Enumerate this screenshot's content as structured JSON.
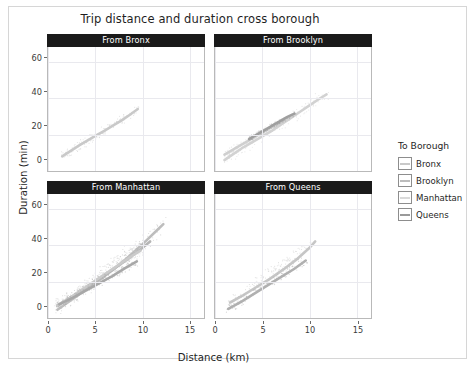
{
  "chart_data": {
    "type": "scatter",
    "title": "Trip distance and duration cross borough",
    "xlabel": "Distance (km)",
    "ylabel": "Duration (min)",
    "xlim": [
      0,
      16.5
    ],
    "ylim": [
      0,
      68
    ],
    "xticks": [
      0,
      5,
      10,
      15
    ],
    "yticks": [
      0,
      20,
      40,
      60
    ],
    "grid": true,
    "legend_title": "To Borough",
    "legend_position": "right",
    "facet_variable": "From Borough",
    "facets": [
      {
        "label": "From Bronx",
        "row": 0,
        "col": 0,
        "series": [
          {
            "name": "Bronx",
            "color": "#c9c9c9",
            "x": [
              1.5,
              2.4,
              3.3,
              4.2,
              5.1,
              6.0,
              6.9,
              7.8,
              8.7,
              9.5
            ],
            "y": [
              8.0,
              11.0,
              14.0,
              16.8,
              19.5,
              22.2,
              25.0,
              27.8,
              31.0,
              34.0
            ]
          }
        ]
      },
      {
        "label": "From Brooklyn",
        "row": 0,
        "col": 1,
        "series": [
          {
            "name": "Brooklyn",
            "color": "#d2d2d2",
            "x": [
              1.0,
              2.0,
              3.0,
              4.0,
              5.0,
              6.0,
              7.0,
              8.0,
              9.0,
              10.0,
              11.0,
              11.8
            ],
            "y": [
              6.0,
              9.5,
              13.0,
              16.0,
              19.0,
              22.0,
              25.5,
              29.0,
              32.5,
              36.0,
              39.5,
              42.0
            ]
          },
          {
            "name": "Manhattan",
            "color": "#cfcfcf",
            "x": [
              1.0,
              2.0,
              3.0,
              4.0,
              5.0,
              6.0,
              7.0,
              7.8
            ],
            "y": [
              9.0,
              12.0,
              15.0,
              18.0,
              21.0,
              24.0,
              27.0,
              29.5
            ]
          },
          {
            "name": "Queens",
            "color": "#9f9f9f",
            "x": [
              3.6,
              4.6,
              5.6,
              6.6,
              7.6,
              8.4
            ],
            "y": [
              17.5,
              20.5,
              23.5,
              26.5,
              29.5,
              31.5
            ]
          }
        ]
      },
      {
        "label": "From Manhattan",
        "row": 1,
        "col": 0,
        "series": [
          {
            "name": "Bronx",
            "color": "#bdbdbd",
            "x": [
              1.0,
              2.5,
              4.0,
              5.5,
              7.0,
              8.5,
              10.0,
              11.5,
              12.2
            ],
            "y": [
              4.5,
              10.0,
              15.5,
              21.0,
              27.0,
              33.5,
              40.5,
              48.0,
              51.5
            ]
          },
          {
            "name": "Brooklyn",
            "color": "#b5b5b5",
            "x": [
              1.0,
              2.5,
              4.0,
              5.5,
              7.0,
              8.5,
              10.0,
              10.8
            ],
            "y": [
              7.0,
              11.5,
              16.5,
              21.5,
              27.0,
              32.5,
              38.5,
              42.0
            ]
          },
          {
            "name": "Manhattan",
            "color": "#cacaca",
            "x": [
              1.0,
              2.0,
              3.0,
              4.0,
              5.0,
              6.0,
              7.0,
              8.0,
              9.0,
              9.8
            ],
            "y": [
              6.5,
              10.0,
              13.5,
              17.0,
              20.5,
              24.0,
              27.5,
              31.0,
              34.5,
              37.0
            ]
          },
          {
            "name": "Queens",
            "color": "#a8a8a8",
            "x": [
              1.2,
              2.6,
              4.0,
              5.4,
              6.8,
              8.2,
              9.4
            ],
            "y": [
              7.5,
              11.0,
              15.0,
              19.0,
              23.0,
              27.5,
              31.0
            ]
          }
        ]
      },
      {
        "label": "From Queens",
        "row": 1,
        "col": 1,
        "series": [
          {
            "name": "Brooklyn",
            "color": "#c6c6c6",
            "x": [
              1.6,
              3.0,
              4.4,
              5.8,
              7.2,
              8.6,
              10.0,
              10.6
            ],
            "y": [
              8.5,
              12.5,
              17.0,
              21.5,
              26.5,
              32.0,
              38.5,
              42.0
            ]
          },
          {
            "name": "Queens",
            "color": "#b0b0b0",
            "x": [
              1.4,
              2.8,
              4.2,
              5.6,
              7.0,
              8.4,
              9.6
            ],
            "y": [
              5.0,
              9.0,
              13.5,
              18.0,
              22.5,
              27.0,
              31.5
            ]
          }
        ]
      }
    ],
    "legend_entries": [
      {
        "label": "Bronx",
        "color": "#c9c9c9"
      },
      {
        "label": "Brooklyn",
        "color": "#bcbcbc"
      },
      {
        "label": "Manhattan",
        "color": "#dadada"
      },
      {
        "label": "Queens",
        "color": "#9a9a9a"
      }
    ]
  }
}
